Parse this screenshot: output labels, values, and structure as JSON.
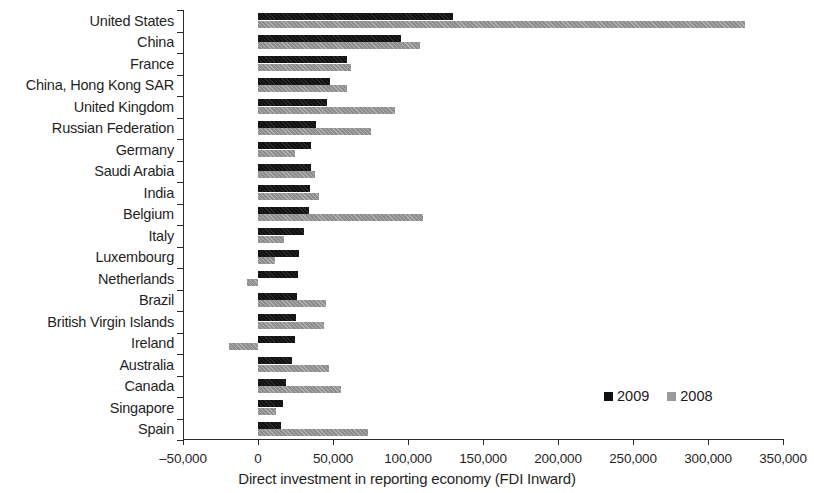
{
  "chart_data": {
    "type": "bar",
    "orientation": "horizontal",
    "title": "",
    "xlabel": "Direct investment in reporting economy (FDI Inward)",
    "ylabel": "",
    "xlim": [
      -50000,
      350000
    ],
    "xticks": [
      -50000,
      0,
      50000,
      100000,
      150000,
      200000,
      250000,
      300000,
      350000
    ],
    "xtick_labels": [
      "–50,000",
      "0",
      "50,000",
      "100,000",
      "150,000",
      "200,000",
      "250,000",
      "300,000",
      "350,000"
    ],
    "grid": false,
    "legend_position": "inside-right-lower",
    "categories": [
      "United States",
      "China",
      "France",
      "China, Hong Kong SAR",
      "United Kingdom",
      "Russian Federation",
      "Germany",
      "Saudi Arabia",
      "India",
      "Belgium",
      "Italy",
      "Luxembourg",
      "Netherlands",
      "Brazil",
      "British Virgin Islands",
      "Ireland",
      "Australia",
      "Canada",
      "Singapore",
      "Spain"
    ],
    "series": [
      {
        "name": "2009",
        "color": "#111111",
        "values": [
          130000,
          95000,
          59600,
          48000,
          45700,
          38700,
          35600,
          35500,
          34600,
          33800,
          30500,
          27300,
          26900,
          25900,
          25000,
          24900,
          22600,
          18700,
          16800,
          15000
        ]
      },
      {
        "name": "2008",
        "color": "#8e8e8e",
        "values": [
          324600,
          108300,
          62200,
          59600,
          91500,
          75000,
          24400,
          38200,
          40400,
          110000,
          17000,
          11400,
          -7300,
          45100,
          44000,
          -19300,
          47200,
          55000,
          11800,
          73000
        ]
      }
    ]
  },
  "legend": {
    "items": [
      {
        "label": "2009",
        "color": "#111111"
      },
      {
        "label": "2008",
        "color": "#9a9a9a"
      }
    ]
  }
}
